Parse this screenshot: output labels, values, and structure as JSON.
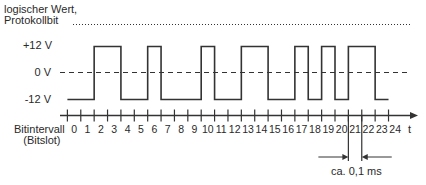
{
  "labels": {
    "y_title_line1": "logischer Wert,",
    "y_title_line2": "Protokollbit",
    "level_high": "+12 V",
    "level_zero": "0 V",
    "level_low": "-12 V",
    "x_title_line1": "Bitintervall",
    "x_title_line2": "(Bitslot)",
    "x_axis_symbol": "t",
    "bit_duration": "ca. 0,1 ms"
  },
  "axis": {
    "slot_labels": [
      "0",
      "1",
      "2",
      "3",
      "4",
      "5",
      "6",
      "7",
      "8",
      "9",
      "10",
      "11",
      "12",
      "13",
      "14",
      "15",
      "16",
      "17",
      "18",
      "19",
      "20",
      "21",
      "22",
      "23",
      "24"
    ]
  },
  "signal": {
    "levels_volts": {
      "high": 12,
      "zero": 0,
      "low": -12
    },
    "slot_states": [
      0,
      0,
      1,
      1,
      0,
      0,
      1,
      0,
      0,
      0,
      1,
      0,
      0,
      1,
      1,
      0,
      0,
      1,
      0,
      1,
      0,
      1,
      1,
      0,
      0
    ],
    "note": "1 = +12 V, 0 = -12 V per bit slot"
  },
  "marker": {
    "from_slot": 21,
    "to_slot": 22,
    "label": "ca. 0,1 ms"
  },
  "colors": {
    "line": "#333333",
    "text": "#2a2a2a",
    "background": "#ffffff"
  }
}
